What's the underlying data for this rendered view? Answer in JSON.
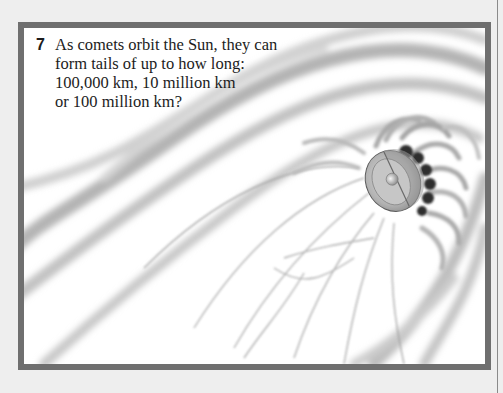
{
  "quiz": {
    "question_number": "7",
    "question_lines": [
      "As comets orbit the Sun, they can",
      "form tails of up to how long:",
      "100,000 km, 10 million km",
      "or 100 million km?"
    ],
    "answer_options": [
      "100,000 km",
      "10 million km",
      "100 million km"
    ]
  },
  "illustration": {
    "subject": "comet-nucleus-with-tail",
    "frame_color": "#6f6f6f",
    "background_color": "#eeeeee"
  }
}
